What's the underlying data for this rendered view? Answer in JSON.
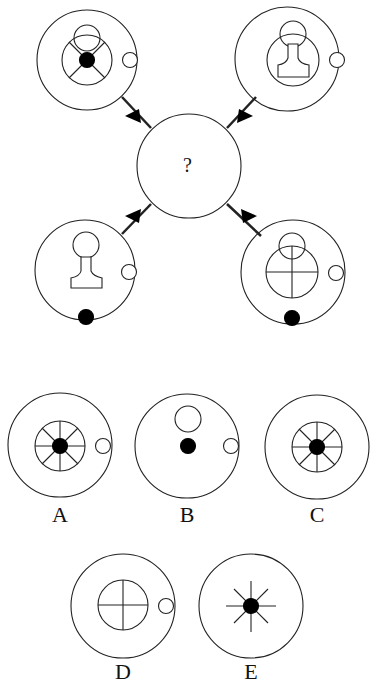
{
  "puzzle": {
    "question_mark": "?",
    "top_left": {
      "outer": true,
      "inner_ring": true,
      "spokes": "x4",
      "black_dot": "center",
      "top_circle": true,
      "side_circle": true
    },
    "top_right": {
      "outer": true,
      "inner_ring": true,
      "pawn": true,
      "top_circle": true,
      "side_circle": true
    },
    "bottom_left": {
      "outer": true,
      "pawn": true,
      "top_circle": true,
      "side_circle": true,
      "black_dot": "bottom"
    },
    "bottom_right": {
      "outer": true,
      "inner_ring": true,
      "spokes": "+",
      "top_circle": true,
      "side_circle": true,
      "black_dot": "bottom"
    }
  },
  "options": [
    {
      "label": "A"
    },
    {
      "label": "B"
    },
    {
      "label": "C"
    },
    {
      "label": "D"
    },
    {
      "label": "E"
    }
  ],
  "colors": {
    "stroke": "#222222",
    "fill": "#000000",
    "background": "#ffffff"
  }
}
